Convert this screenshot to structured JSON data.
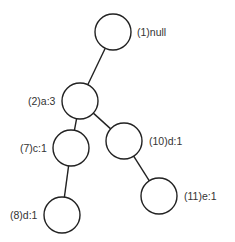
{
  "diagram": {
    "type": "tree",
    "nodes": [
      {
        "id": "1",
        "label": "(1)null",
        "cx": 113,
        "cy": 32,
        "r": 18,
        "lx": 137,
        "ly": 36
      },
      {
        "id": "2",
        "label": "(2)a:3",
        "cx": 80,
        "cy": 101,
        "r": 18,
        "lx": 28,
        "ly": 105
      },
      {
        "id": "7",
        "label": "(7)c:1",
        "cx": 71,
        "cy": 148,
        "r": 18,
        "lx": 20,
        "ly": 152
      },
      {
        "id": "10",
        "label": "(10)d:1",
        "cx": 124,
        "cy": 141,
        "r": 18,
        "lx": 149,
        "ly": 145
      },
      {
        "id": "8",
        "label": "(8)d:1",
        "cx": 62,
        "cy": 215,
        "r": 18,
        "lx": 10,
        "ly": 219
      },
      {
        "id": "11",
        "label": "(11)e:1",
        "cx": 159,
        "cy": 196,
        "r": 18,
        "lx": 184,
        "ly": 200
      }
    ],
    "edges": [
      {
        "from": "1",
        "to": "2"
      },
      {
        "from": "2",
        "to": "7"
      },
      {
        "from": "2",
        "to": "10"
      },
      {
        "from": "7",
        "to": "8"
      },
      {
        "from": "10",
        "to": "11"
      }
    ]
  }
}
